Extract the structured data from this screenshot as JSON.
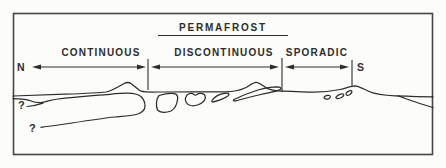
{
  "colors": {
    "paper": "#fcfcfa",
    "ink": "#2d2d2d",
    "frame": "#454545"
  },
  "diagram": {
    "title": "PERMAFROST",
    "zones": [
      {
        "label": "CONTINUOUS"
      },
      {
        "label": "DISCONTINUOUS"
      },
      {
        "label": "SPORADIC"
      }
    ],
    "north_label": "N",
    "south_label": "S",
    "question_marks": [
      "?",
      "?"
    ]
  }
}
